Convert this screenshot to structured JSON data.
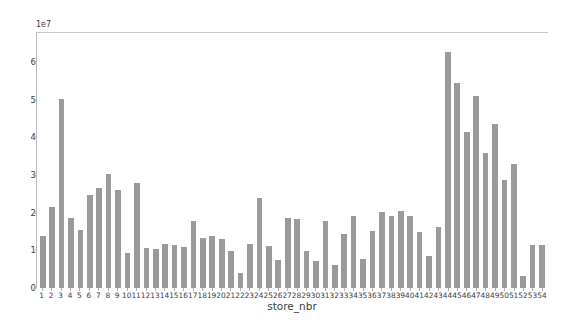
{
  "chart_data": {
    "type": "bar",
    "title": "",
    "xlabel": "store_nbr",
    "ylabel": "Sum of unit_sales of store_nbr",
    "offset_text": "1e7",
    "ylim": [
      0,
      68000000
    ],
    "grid": false,
    "legend": null,
    "bar_color": "#9a9a9a",
    "y_ticks": [
      0,
      1,
      2,
      3,
      4,
      5,
      6
    ],
    "y_tick_labels": [
      "0",
      "1",
      "2",
      "3",
      "4",
      "5",
      "6"
    ],
    "y_tick_scale": 10000000,
    "categories": [
      "1",
      "2",
      "3",
      "4",
      "5",
      "6",
      "7",
      "8",
      "9",
      "10",
      "11",
      "12",
      "13",
      "14",
      "15",
      "16",
      "17",
      "18",
      "19",
      "20",
      "21",
      "22",
      "23",
      "24",
      "25",
      "26",
      "27",
      "28",
      "29",
      "30",
      "31",
      "32",
      "33",
      "34",
      "35",
      "36",
      "37",
      "38",
      "39",
      "40",
      "41",
      "42",
      "43",
      "44",
      "45",
      "46",
      "47",
      "48",
      "49",
      "50",
      "51",
      "52",
      "53",
      "54"
    ],
    "values": [
      14000000,
      21500000,
      50500000,
      18800000,
      15500000,
      24700000,
      26700000,
      30300000,
      26100000,
      9300000,
      28000000,
      10600000,
      10500000,
      11700000,
      11400000,
      10900000,
      18000000,
      13400000,
      13800000,
      13100000,
      9900000,
      4000000,
      11700000,
      24000000,
      11200000,
      7600000,
      18700000,
      18300000,
      9800000,
      7100000,
      17800000,
      6100000,
      14300000,
      19200000,
      7700000,
      15200000,
      20300000,
      19300000,
      20600000,
      19100000,
      15000000,
      8500000,
      16400000,
      63000000,
      54800000,
      41700000,
      51200000,
      36000000,
      43800000,
      28800000,
      33000000,
      3100000,
      11400000,
      11500000
    ],
    "caption": ""
  }
}
